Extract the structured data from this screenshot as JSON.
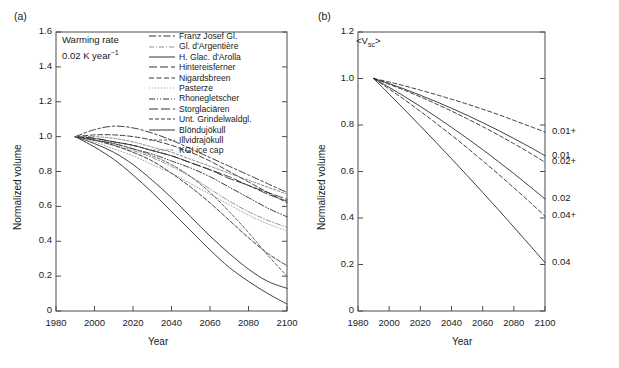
{
  "figure": {
    "panels": [
      {
        "tag": "(a)",
        "annotation_line1": "Warming rate",
        "annotation_line2_pre": "0.02 K year",
        "annotation_line2_sup": "−1",
        "xlabel": "Year",
        "ylabel": "Normalized volume",
        "xticks": [
          "1980",
          "2000",
          "2020",
          "2040",
          "2060",
          "2080",
          "2100"
        ],
        "yticks": [
          "0",
          "0.2",
          "0.4",
          "0.6",
          "0.8",
          "1.0",
          "1.2",
          "1.4",
          "1.6"
        ],
        "legend": [
          {
            "label": "Franz Josef Gl.",
            "style": "dashdot-long"
          },
          {
            "label": "Gl. d'Argentière",
            "style": "dashdot-light"
          },
          {
            "label": "H. Glac. d'Arolla",
            "style": "solid"
          },
          {
            "label": "Hintereisferner",
            "style": "dashed-long"
          },
          {
            "label": "Nigardsbreen",
            "style": "dashed-med"
          },
          {
            "label": "Pasterze",
            "style": "dotted"
          },
          {
            "label": "Rhonegletscher",
            "style": "dashdotdot"
          },
          {
            "label": "Storglaciären",
            "style": "dashed-wide"
          },
          {
            "label": "Unt. Grindelwaldgl.",
            "style": "dashed-short"
          },
          {
            "label": "Blöndujökull",
            "style": "solid"
          },
          {
            "label": "Illvidrajökull",
            "style": "dashed-fine"
          },
          {
            "label": "KGI ice cap",
            "style": "dashed-tiny"
          }
        ]
      },
      {
        "tag": "(b)",
        "annotation_pre": "<V",
        "annotation_sub": "sc",
        "annotation_post": ">",
        "xlabel": "Year",
        "ylabel": "Normalized volume",
        "xticks": [
          "1980",
          "2000",
          "2020",
          "2040",
          "2060",
          "2080",
          "2100"
        ],
        "yticks": [
          "0",
          "0.2",
          "0.4",
          "0.6",
          "0.8",
          "1.0",
          "1.2"
        ],
        "curve_labels": [
          "0.01+",
          "0.01",
          "0.02+",
          "0.02",
          "0.04+",
          "0.04"
        ]
      }
    ]
  },
  "chart_data": [
    {
      "type": "line",
      "panel": "(a)",
      "title": "",
      "xlabel": "Year",
      "ylabel": "Normalized volume",
      "xlim": [
        1980,
        2100
      ],
      "ylim": [
        0,
        1.6
      ],
      "xticks": [
        1980,
        2000,
        2020,
        2040,
        2060,
        2080,
        2100
      ],
      "yticks": [
        0,
        0.2,
        0.4,
        0.6,
        0.8,
        1.0,
        1.2,
        1.4,
        1.6
      ],
      "grid": false,
      "legend_position": "top-right",
      "annotations": [
        "Warming rate",
        "0.02 K year−1"
      ],
      "x": [
        1990,
        2000,
        2010,
        2020,
        2030,
        2040,
        2050,
        2060,
        2070,
        2080,
        2090,
        2100
      ],
      "series": [
        {
          "name": "Franz Josef Gl.",
          "style": "dashdot-long",
          "values": [
            1.0,
            1.04,
            1.06,
            1.05,
            1.02,
            0.98,
            0.93,
            0.88,
            0.83,
            0.78,
            0.73,
            0.68
          ]
        },
        {
          "name": "Gl. d'Argentière",
          "style": "dashdot-light",
          "values": [
            1.0,
            0.98,
            0.95,
            0.92,
            0.88,
            0.83,
            0.77,
            0.7,
            0.63,
            0.57,
            0.52,
            0.48
          ]
        },
        {
          "name": "H. Glac. d'Arolla",
          "style": "solid",
          "values": [
            1.0,
            0.96,
            0.91,
            0.84,
            0.75,
            0.65,
            0.54,
            0.43,
            0.33,
            0.24,
            0.17,
            0.13
          ]
        },
        {
          "name": "Hintereisferner",
          "style": "dashed-long",
          "values": [
            1.0,
            0.99,
            0.97,
            0.95,
            0.92,
            0.89,
            0.85,
            0.81,
            0.77,
            0.72,
            0.68,
            0.64
          ]
        },
        {
          "name": "Nigardsbreen",
          "style": "dashed-med",
          "values": [
            1.0,
            1.01,
            1.01,
            1.0,
            0.98,
            0.95,
            0.91,
            0.86,
            0.8,
            0.74,
            0.68,
            0.62
          ]
        },
        {
          "name": "Pasterze",
          "style": "dotted",
          "values": [
            1.0,
            0.97,
            0.93,
            0.89,
            0.84,
            0.79,
            0.73,
            0.67,
            0.61,
            0.55,
            0.5,
            0.46
          ]
        },
        {
          "name": "Rhonegletscher",
          "style": "dashdotdot",
          "values": [
            1.0,
            0.98,
            0.96,
            0.93,
            0.9,
            0.86,
            0.82,
            0.77,
            0.71,
            0.65,
            0.59,
            0.54
          ]
        },
        {
          "name": "Storglaciären",
          "style": "dashed-wide",
          "values": [
            1.0,
            0.99,
            0.97,
            0.95,
            0.92,
            0.89,
            0.85,
            0.81,
            0.76,
            0.72,
            0.67,
            0.63
          ]
        },
        {
          "name": "Unt. Grindelwaldgl.",
          "style": "dashed-short",
          "values": [
            1.0,
            0.98,
            0.95,
            0.91,
            0.86,
            0.79,
            0.71,
            0.62,
            0.52,
            0.42,
            0.33,
            0.26
          ]
        },
        {
          "name": "Blöndujökull",
          "style": "solid",
          "values": [
            1.0,
            0.94,
            0.87,
            0.78,
            0.68,
            0.57,
            0.46,
            0.35,
            0.25,
            0.17,
            0.1,
            0.04
          ]
        },
        {
          "name": "Illvidrajökull",
          "style": "dashed-fine",
          "values": [
            1.0,
            0.98,
            0.96,
            0.93,
            0.89,
            0.84,
            0.77,
            0.68,
            0.57,
            0.45,
            0.32,
            0.2
          ]
        },
        {
          "name": "KGI ice cap",
          "style": "dashed-tiny",
          "values": [
            1.0,
            1.0,
            0.99,
            0.97,
            0.94,
            0.91,
            0.87,
            0.83,
            0.79,
            0.75,
            0.71,
            0.67
          ]
        }
      ]
    },
    {
      "type": "line",
      "panel": "(b)",
      "title": "",
      "xlabel": "Year",
      "ylabel": "Normalized volume",
      "xlim": [
        1980,
        2100
      ],
      "ylim": [
        0,
        1.2
      ],
      "xticks": [
        1980,
        2000,
        2020,
        2040,
        2060,
        2080,
        2100
      ],
      "yticks": [
        0,
        0.2,
        0.4,
        0.6,
        0.8,
        1.0,
        1.2
      ],
      "grid": false,
      "legend_position": "right-of-axis",
      "annotations": [
        "<Vsc>"
      ],
      "x": [
        1990,
        2000,
        2010,
        2020,
        2030,
        2040,
        2050,
        2060,
        2070,
        2080,
        2090,
        2100
      ],
      "series": [
        {
          "name": "0.01+",
          "style": "dashed",
          "values": [
            1.0,
            0.985,
            0.968,
            0.95,
            0.931,
            0.911,
            0.89,
            0.868,
            0.845,
            0.82,
            0.795,
            0.77
          ]
        },
        {
          "name": "0.01",
          "style": "solid",
          "values": [
            1.0,
            0.978,
            0.954,
            0.928,
            0.901,
            0.872,
            0.842,
            0.81,
            0.777,
            0.742,
            0.706,
            0.668
          ]
        },
        {
          "name": "0.02+",
          "style": "dashed",
          "values": [
            1.0,
            0.975,
            0.949,
            0.921,
            0.891,
            0.86,
            0.827,
            0.793,
            0.757,
            0.72,
            0.681,
            0.64
          ]
        },
        {
          "name": "0.02",
          "style": "solid",
          "values": [
            1.0,
            0.962,
            0.922,
            0.88,
            0.836,
            0.79,
            0.743,
            0.694,
            0.643,
            0.591,
            0.537,
            0.482
          ]
        },
        {
          "name": "0.04+",
          "style": "dashed",
          "values": [
            1.0,
            0.955,
            0.908,
            0.859,
            0.808,
            0.756,
            0.702,
            0.646,
            0.589,
            0.53,
            0.47,
            0.408
          ]
        },
        {
          "name": "0.04",
          "style": "solid",
          "values": [
            1.0,
            0.933,
            0.865,
            0.796,
            0.726,
            0.655,
            0.583,
            0.51,
            0.436,
            0.361,
            0.285,
            0.208
          ]
        }
      ]
    }
  ]
}
